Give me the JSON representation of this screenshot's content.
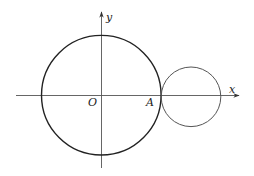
{
  "figure": {
    "axes": {
      "x_label": "x",
      "y_label": "y",
      "origin_label": "O",
      "axis_color": "#555555"
    },
    "points": [
      {
        "label": "O",
        "role": "origin"
      },
      {
        "label": "A",
        "role": "tangent point of the two circles on the x-axis"
      }
    ],
    "circles": [
      {
        "name": "large-circle",
        "center_label": "O",
        "color": "#222222",
        "relative_radius": 2
      },
      {
        "name": "small-circle",
        "tangent_at": "A",
        "color": "#555555",
        "relative_radius": 1
      }
    ]
  }
}
